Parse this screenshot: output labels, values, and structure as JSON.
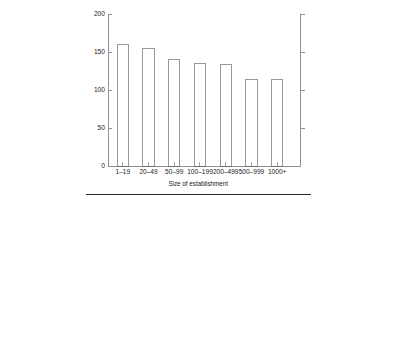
{
  "chart_data": {
    "type": "bar",
    "title": "",
    "subtitle": "",
    "xlabel": "Size of establishment",
    "ylabel": "",
    "categories": [
      "1–19",
      "20–49",
      "50–99",
      "100–199",
      "200–499",
      "500–999",
      "1000+"
    ],
    "values": [
      163,
      160,
      155,
      140,
      135,
      134,
      114
    ],
    "series": [
      {
        "name": "",
        "values": [
          163,
          160,
          155,
          140,
          135,
          134,
          114
        ]
      }
    ],
    "ylim": [
      0,
      200
    ],
    "y_ticks": [
      0,
      50,
      100,
      150,
      200
    ],
    "y_tick_labels": [
      "0",
      "50",
      "100",
      "150",
      "200"
    ],
    "x_tick_labels": [
      "1–19",
      "20–49",
      "50–99",
      "100–199",
      "200–499",
      "500–999",
      "1000+"
    ],
    "grid": false,
    "legend": false,
    "legend_position": "none",
    "annotations": [],
    "axes": {
      "left_spine": true,
      "right_spine": true,
      "bottom_spine": true,
      "top_spine": false,
      "left_ticks_direction": "inward",
      "right_ticks_direction": "outward"
    },
    "colors": {
      "bar_fill": "#ffffff",
      "bar_edge": "#555555",
      "axis": "#4a4a4a",
      "text": "#1a1a1a",
      "rule": "#1d1d1d",
      "background": "#ffffff"
    }
  },
  "figure": {
    "footer_rule": true
  }
}
